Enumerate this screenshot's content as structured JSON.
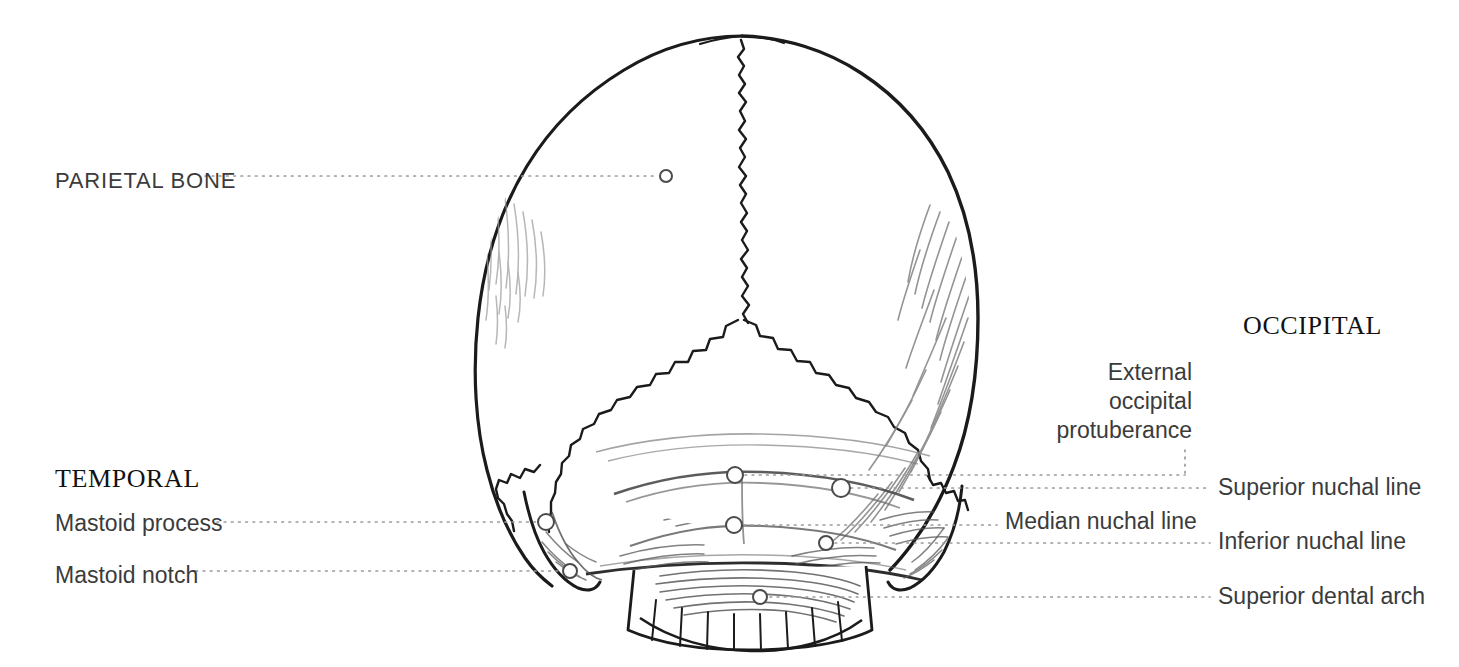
{
  "figure": {
    "background_color": "#ffffff",
    "ink_color": "#1b1b1b",
    "leader_color": "#9a9a9a",
    "text_color": "#3b3b3b"
  },
  "groups": [
    {
      "id": "temporal",
      "label": "TEMPORAL",
      "x": 55,
      "y": 464
    },
    {
      "id": "occipital",
      "label": "OCCIPITAL",
      "x": 1243,
      "y": 311
    }
  ],
  "labels": [
    {
      "id": "parietal-bone",
      "text": "PARIETAL BONE",
      "style": "caps",
      "align": "left",
      "x": 55,
      "y": 168,
      "marker": {
        "x": 666,
        "y": 176,
        "r": 6
      },
      "leader": {
        "from_x": 205,
        "to_x": 657,
        "y": 176
      }
    },
    {
      "id": "mastoid-process",
      "text": "Mastoid process",
      "style": "feature",
      "align": "left",
      "x": 55,
      "y": 510,
      "marker": {
        "x": 546,
        "y": 522,
        "r": 8
      },
      "leader": {
        "from_x": 217,
        "to_x": 537,
        "y": 522
      }
    },
    {
      "id": "mastoid-notch",
      "text": "Mastoid notch",
      "style": "feature",
      "align": "left",
      "x": 55,
      "y": 562,
      "marker": {
        "x": 570,
        "y": 571,
        "r": 7
      },
      "leader": {
        "from_x": 196,
        "to_x": 562,
        "y": 571
      }
    },
    {
      "id": "external-occipital-protuberance",
      "text": "External occipital protuberance",
      "lines": [
        "External",
        "occipital",
        "protuberance"
      ],
      "style": "multiline",
      "align": "right",
      "x": 1011,
      "y": 358,
      "right_edge": 1192,
      "marker": {
        "x": 735,
        "y": 475,
        "r": 8
      },
      "leader": {
        "from_x": 745,
        "to_x": 1185,
        "y": 475
      },
      "vertical_leader": {
        "x": 1185,
        "from_y": 450,
        "to_y": 475
      }
    },
    {
      "id": "superior-nuchal-line",
      "text": "Superior nuchal line",
      "style": "feature",
      "align": "left",
      "x": 1218,
      "y": 474,
      "marker": {
        "x": 841,
        "y": 488,
        "r": 9
      },
      "leader": {
        "from_x": 851,
        "to_x": 1210,
        "y": 488
      }
    },
    {
      "id": "median-nuchal-line",
      "text": "Median nuchal line",
      "style": "feature",
      "align": "left",
      "x": 1005,
      "y": 508,
      "marker": {
        "x": 734,
        "y": 525,
        "r": 8
      },
      "leader": {
        "from_x": 744,
        "to_x": 997,
        "y": 525
      }
    },
    {
      "id": "inferior-nuchal-line",
      "text": "Inferior nuchal line",
      "style": "feature",
      "align": "left",
      "x": 1218,
      "y": 528,
      "marker": {
        "x": 826,
        "y": 543,
        "r": 7
      },
      "leader": {
        "from_x": 835,
        "to_x": 1210,
        "y": 543
      }
    },
    {
      "id": "superior-dental-arch",
      "text": "Superior dental arch",
      "style": "feature",
      "align": "left",
      "x": 1218,
      "y": 583,
      "marker": {
        "x": 760,
        "y": 597,
        "r": 7
      },
      "leader": {
        "from_x": 770,
        "to_x": 1210,
        "y": 597
      }
    }
  ]
}
